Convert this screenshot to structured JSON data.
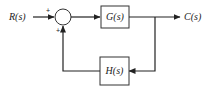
{
  "diagram": {
    "type": "feedback-control-block-diagram",
    "input": {
      "label": "R(s)"
    },
    "output": {
      "label": "C(s)"
    },
    "summing_junction": {
      "input_sign": "+",
      "feedback_sign": "+"
    },
    "forward_block": {
      "label": "G(s)"
    },
    "feedback_block": {
      "label": "H(s)"
    },
    "colors": {
      "stroke": "#222222",
      "background": "#ffffff"
    }
  }
}
